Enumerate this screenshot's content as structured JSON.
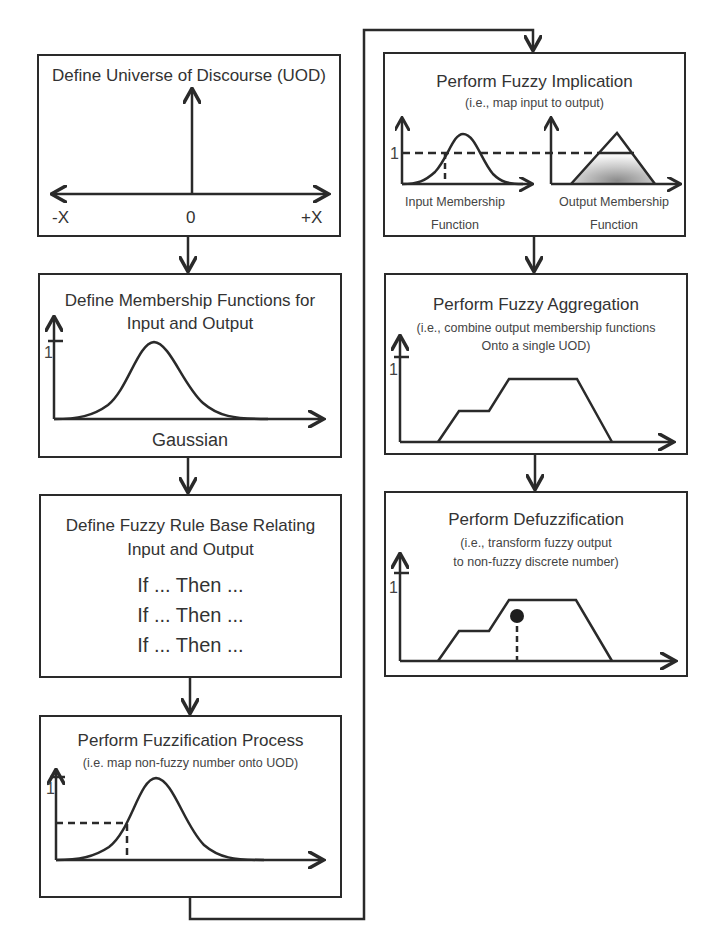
{
  "steps": {
    "uod": {
      "title": "Define Universe of Discourse (UOD)",
      "axis_left": "-X",
      "axis_center": "0",
      "axis_right": "+X"
    },
    "membership": {
      "title_line1": "Define Membership Functions for",
      "title_line2": "Input and Output",
      "y_tick": "1",
      "curve_label": "Gaussian"
    },
    "rule_base": {
      "title_line1": "Define Fuzzy Rule Base Relating",
      "title_line2": "Input and Output",
      "rules": [
        "If ... Then ...",
        "If ... Then ...",
        "If ... Then ..."
      ]
    },
    "fuzzification": {
      "title": "Perform Fuzzification Process",
      "subtitle": "(i.e. map non-fuzzy number onto UOD)",
      "y_tick": "1"
    },
    "implication": {
      "title": "Perform Fuzzy Implication",
      "subtitle": "(i.e., map input to output)",
      "y_tick": "1",
      "input_label_line1": "Input Membership",
      "input_label_line2": "Function",
      "output_label_line1": "Output Membership",
      "output_label_line2": "Function"
    },
    "aggregation": {
      "title": "Perform Fuzzy Aggregation",
      "subtitle_line1": "(i.e., combine output membership functions",
      "subtitle_line2": "Onto a single UOD)",
      "y_tick": "1"
    },
    "defuzzification": {
      "title": "Perform Defuzzification",
      "subtitle_line1": "(i.e., transform fuzzy output",
      "subtitle_line2": "to non-fuzzy discrete number)",
      "y_tick": "1"
    }
  },
  "colors": {
    "line": "#2a2a2a",
    "shade_light": "#f2f2f2",
    "shade_dark": "#9a9a9a"
  }
}
